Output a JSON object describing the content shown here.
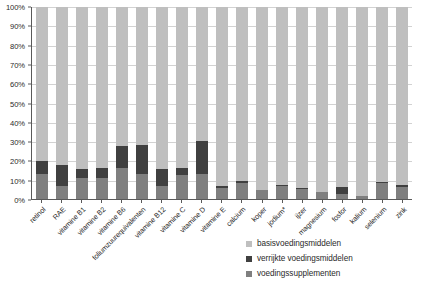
{
  "chart_data": {
    "type": "bar",
    "variant": "stacked-100-percent",
    "title": "",
    "subtitle": "",
    "xlabel": "",
    "ylabel": "",
    "ylim": [
      0,
      100
    ],
    "yticks": [
      "0%",
      "10%",
      "20%",
      "30%",
      "40%",
      "50%",
      "60%",
      "70%",
      "80%",
      "90%",
      "100%"
    ],
    "ytick_values": [
      0,
      10,
      20,
      30,
      40,
      50,
      60,
      70,
      80,
      90,
      100
    ],
    "grid": true,
    "legend_position": "bottom-right",
    "categories": [
      "retinol",
      "RAE",
      "vitamine B1",
      "vitamine B2",
      "vitamine B6",
      "foliumzuurequivalenten",
      "vitamine B12",
      "vitamine C",
      "vitamine D",
      "vitamine E",
      "calcium",
      "koper",
      "jodium*",
      "ijzer",
      "magnesium",
      "fosfor",
      "kalium",
      "selenium",
      "zink"
    ],
    "series": [
      {
        "name": "voedingssupplementen",
        "color": "#7f7f7f",
        "values": [
          13.0,
          7.0,
          11.0,
          11.0,
          16.0,
          13.0,
          7.0,
          12.5,
          13.0,
          5.5,
          8.5,
          4.5,
          7.0,
          5.0,
          3.5,
          2.5,
          1.5,
          8.5,
          6.5
        ]
      },
      {
        "name": "verrijkte voedingsmiddelen",
        "color": "#404040",
        "values": [
          7.0,
          10.5,
          4.5,
          5.0,
          11.5,
          15.0,
          8.5,
          3.5,
          17.0,
          1.5,
          1.0,
          0.3,
          0.5,
          0.5,
          0.3,
          4.0,
          0.3,
          0.5,
          1.0
        ]
      },
      {
        "name": "basisvoedingsmiddelen",
        "color": "#bfbfbf",
        "values": [
          80.0,
          82.5,
          84.5,
          84.0,
          72.5,
          72.0,
          84.5,
          84.0,
          70.0,
          93.0,
          90.5,
          95.2,
          92.5,
          94.5,
          96.2,
          93.5,
          98.2,
          91.0,
          92.5
        ]
      }
    ]
  },
  "legend": {
    "items": [
      {
        "label": "basisvoedingsmiddelen",
        "color": "#bfbfbf"
      },
      {
        "label": "verrijkte voedingsmiddelen",
        "color": "#404040"
      },
      {
        "label": "voedingssupplementen",
        "color": "#7f7f7f"
      }
    ]
  },
  "footnote": {
    "text": ""
  }
}
